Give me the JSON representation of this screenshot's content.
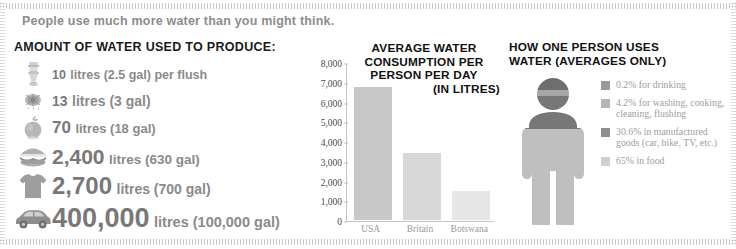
{
  "banner": {
    "text": "People use much more water than you might think."
  },
  "left": {
    "heading": "AMOUNT OF WATER USED TO PRODUCE:",
    "items": [
      {
        "icon": "toilet-icon",
        "number": "10",
        "suffix": "litres (2.5 gal) per flush"
      },
      {
        "icon": "shower-icon",
        "number": "13",
        "suffix": "litres (3 gal)"
      },
      {
        "icon": "apple-icon",
        "number": "70",
        "suffix": "litres (18 gal)"
      },
      {
        "icon": "hamburger-icon",
        "number": "2,400",
        "suffix": "litres (630 gal)"
      },
      {
        "icon": "tshirt-icon",
        "number": "2,700",
        "suffix": "litres (700 gal)"
      },
      {
        "icon": "car-icon",
        "number": "400,000",
        "suffix": "litres (100,000 gal)"
      }
    ]
  },
  "chart_data": {
    "type": "bar",
    "title": "AVERAGE WATER CONSUMPTION PER PERSON PER DAY (IN LITRES)",
    "title_lines": [
      "AVERAGE WATER",
      "CONSUMPTION PER",
      "PERSON PER DAY",
      "(IN LITRES)"
    ],
    "categories": [
      "USA",
      "Britain",
      "Botswana"
    ],
    "values": [
      6800,
      3400,
      1500
    ],
    "xlabel": "",
    "ylabel": "",
    "ylim": [
      0,
      8000
    ],
    "yticks": [
      0,
      1000,
      2000,
      3000,
      4000,
      5000,
      6000,
      7000,
      8000
    ],
    "ytick_labels": [
      "0",
      "1,000",
      "2,000",
      "3,000",
      "4,000",
      "5,000",
      "6,000",
      "7,000",
      "8,000"
    ],
    "grid": false,
    "legend": "none",
    "bar_colors": [
      "#c8c8c8",
      "#d8d8d8",
      "#e6e6e6"
    ]
  },
  "right": {
    "heading_lines": [
      "HOW ONE PERSON USES",
      "WATER (AVERAGES ONLY)"
    ],
    "figure_name": "person-pictogram",
    "legend": [
      {
        "percent": "0.2%",
        "label": "0.2% for drinking",
        "color": "#9a9a9a"
      },
      {
        "percent": "4.2%",
        "label": "4.2% for washing, cooking, cleaning, flushing",
        "color": "#b5b5b5"
      },
      {
        "percent": "30.6%",
        "label": "30.6% in manufactured goods (car, bike, TV, etc.)",
        "color": "#8e8e8e"
      },
      {
        "percent": "65%",
        "label": "65% in food",
        "color": "#cfcfcf"
      }
    ]
  },
  "colors": {
    "banner_text": "#8c8c8c",
    "heading_text": "#111111",
    "list_text": "#7a7a7a",
    "legend_text": "#9d9d9d",
    "axis": "#c4c4c4",
    "background": "#ffffff"
  }
}
